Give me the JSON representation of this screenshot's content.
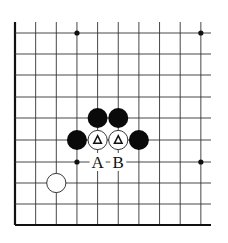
{
  "diagram": {
    "type": "go-board-fragment",
    "corner": "bottom-left",
    "columns": 10,
    "rows": 10,
    "colors": {
      "line": "#333333",
      "edge": "#111111",
      "black_stone": "#0a0a0a",
      "white_stone_fill": "#ffffff",
      "white_stone_stroke": "#222222",
      "star_point": "#111111"
    },
    "star_points": [
      {
        "col": 3,
        "row": 0
      },
      {
        "col": 9,
        "row": 0
      },
      {
        "col": 3,
        "row": 6
      },
      {
        "col": 9,
        "row": 6
      }
    ],
    "stones": [
      {
        "color": "black",
        "col": 4,
        "row": 4
      },
      {
        "color": "black",
        "col": 5,
        "row": 4
      },
      {
        "color": "black",
        "col": 3,
        "row": 5
      },
      {
        "color": "white",
        "col": 4,
        "row": 5,
        "marker": "triangle"
      },
      {
        "color": "white",
        "col": 5,
        "row": 5,
        "marker": "triangle"
      },
      {
        "color": "black",
        "col": 6,
        "row": 5
      },
      {
        "color": "white",
        "col": 2,
        "row": 7
      }
    ],
    "labels": [
      {
        "text": "A",
        "col": 4,
        "row": 6
      },
      {
        "text": "B",
        "col": 5,
        "row": 6
      }
    ]
  }
}
